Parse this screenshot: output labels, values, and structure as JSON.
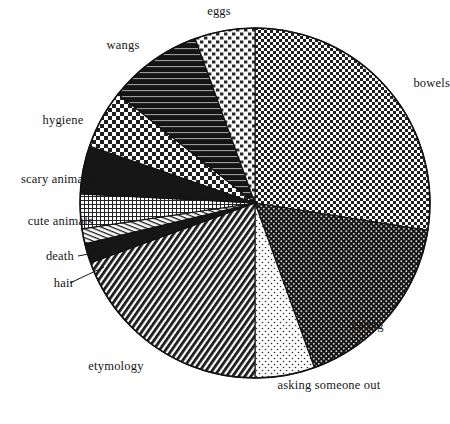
{
  "chart_data": {
    "type": "pie",
    "title": "",
    "subtitle": "",
    "xlabel": "",
    "ylabel": "",
    "legend_position": "outside-labels",
    "grid": false,
    "center": {
      "x": 255,
      "y": 203
    },
    "radius": 175,
    "start_angle_deg": 0,
    "direction": "clockwise",
    "labels": [
      "bowels",
      "eating",
      "asking someone out",
      "etymology",
      "hair",
      "death",
      "cute animals",
      "scary animals",
      "hygiene",
      "wangs",
      "eggs"
    ],
    "values": [
      27.5,
      17.0,
      9.0,
      21.5,
      2.0,
      1.5,
      3.5,
      5.0,
      6.0,
      4.5,
      2.5
    ],
    "units": "percent",
    "slices": [
      {
        "label": "bowels",
        "value": 27.5,
        "start_deg": 0.0,
        "end_deg": 99.0,
        "pattern": "fine-checker",
        "color": "#2b2b2b"
      },
      {
        "label": "eating",
        "value": 17.0,
        "start_deg": 99.0,
        "end_deg": 160.2,
        "pattern": "dark-dots",
        "color": "#252525"
      },
      {
        "label": "asking someone out",
        "value": 9.0,
        "start_deg": 160.2,
        "end_deg": 180.0,
        "pattern": "light-dots",
        "color": "#d8d8d8"
      },
      {
        "label": "etymology",
        "value": 21.5,
        "start_deg": 180.0,
        "end_deg": 250.0,
        "pattern": "diagonal-hatch",
        "color": "#303030"
      },
      {
        "label": "hair",
        "value": 2.0,
        "start_deg": 250.0,
        "end_deg": 256.5,
        "pattern": "solid-dark",
        "color": "#1c1c1c"
      },
      {
        "label": "death",
        "value": 1.5,
        "start_deg": 256.5,
        "end_deg": 261.5,
        "pattern": "horizontal-lines",
        "color": "#f0f0f0"
      },
      {
        "label": "cute animals",
        "value": 3.5,
        "start_deg": 261.5,
        "end_deg": 273.0,
        "pattern": "fine-grid",
        "color": "#6a6a6a"
      },
      {
        "label": "scary animals",
        "value": 5.0,
        "start_deg": 273.0,
        "end_deg": 289.0,
        "pattern": "solid-dark",
        "color": "#1c1c1c"
      },
      {
        "label": "hygiene",
        "value": 6.0,
        "start_deg": 289.0,
        "end_deg": 308.5,
        "pattern": "coarse-checker",
        "color": "#808080"
      },
      {
        "label": "wangs",
        "value": 4.5,
        "start_deg": 308.5,
        "end_deg": 340.0,
        "pattern": "dark-horizontal",
        "color": "#262626"
      },
      {
        "label": "eggs",
        "value": 2.5,
        "start_deg": 340.0,
        "end_deg": 360.0,
        "pattern": "basketweave-light",
        "color": "#c9c9c9"
      }
    ]
  },
  "labels": {
    "eggs": "eggs",
    "wangs": "wangs",
    "hygiene": "hygiene",
    "scary_animals": "scary animals",
    "cute_animals": "cute animals",
    "death": "death",
    "hair": "hair",
    "etymology": "etymology",
    "asking_someone_out": "asking someone out",
    "eating": "eating",
    "bowels": "bowels"
  },
  "style": {
    "background": "#ffffff",
    "outline": "#111111",
    "text": "#151515"
  }
}
